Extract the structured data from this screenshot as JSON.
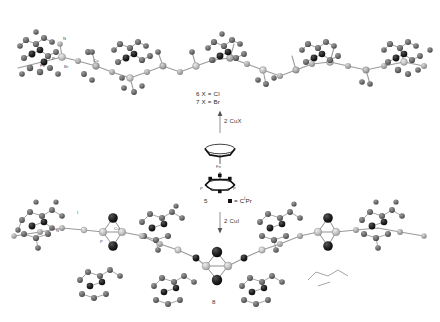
{
  "scheme": {
    "title": "Reaction scheme of ferrocene-based diphosphine 5 with copper halides",
    "background_color": "#ffffff",
    "products": {
      "top": {
        "id_lines": [
          "6  X = Cl",
          "7  X = Br"
        ],
        "compound_numbers": [
          "6",
          "7"
        ],
        "halides": [
          "Cl",
          "Br"
        ],
        "description": "One-dimensional coordination polymer chain (zigzag) built from CuX units bridging ferrocenyl diphosphine ligands",
        "atom_labels": [
          "N",
          "P",
          "Fe",
          "Br",
          "Cu"
        ]
      },
      "bottom": {
        "id_line": "8",
        "compound_number": "8",
        "description": "One-dimensional coordination polymer containing Cu2I2 rhomboid (diamond) cores bridged by ferrocenyl diphosphine ligands",
        "atom_labels": [
          "I",
          "Cu",
          "N",
          "P",
          "Fe"
        ]
      }
    },
    "starting_material": {
      "compound_number": "5",
      "name": "ferrocene-based bis(phosphaalkene) / diphosphine ligand",
      "metal_label": "Fe",
      "phosphorus_labels": [
        "P",
        "P"
      ],
      "legend_symbol": "square",
      "legend_text": "= C",
      "legend_superscript": "i",
      "legend_suffix": "Pr",
      "legend_full": "■ = C Pr",
      "substituent_count": 4
    },
    "arrows": [
      {
        "name": "arrow-up",
        "direction": "up",
        "reagent_prefix": "2",
        "reagent": "CuX",
        "label": "2 CuX"
      },
      {
        "name": "arrow-down",
        "direction": "down",
        "reagent_prefix": "2",
        "reagent": "CuI",
        "label": "2 CuI"
      }
    ],
    "colors": {
      "carbon": "#6e6e6e",
      "dark_atom": "#1c1c1c",
      "metal_cu": "#b9b9b9",
      "halide": "#9a9a9a",
      "bond": "#8c8c8c",
      "text": "#2b2b2b",
      "background": "#ffffff"
    }
  }
}
